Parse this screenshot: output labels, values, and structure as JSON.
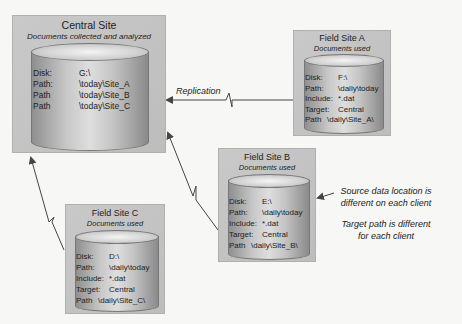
{
  "central": {
    "title": "Central Site",
    "subtitle": "Documents collected and analyzed",
    "rows": [
      {
        "key": "Disk:",
        "value": "G:\\"
      },
      {
        "key": "Path:",
        "value": "\\today\\Site_A"
      },
      {
        "key": "Path",
        "value": "\\today\\Site_B"
      },
      {
        "key": "Path",
        "value": "\\today\\Site_C"
      }
    ]
  },
  "siteA": {
    "title": "Field Site A",
    "subtitle": "Documents used",
    "rows": [
      {
        "key": "Disk:",
        "value": "F:\\"
      },
      {
        "key": "Path:",
        "value": "\\daily\\today"
      },
      {
        "key": "Include:",
        "value": "*.dat"
      },
      {
        "key": "Target:",
        "value": "Central"
      },
      {
        "key": "Path",
        "value": "\\daily\\Site_A\\"
      }
    ]
  },
  "siteB": {
    "title": "Field Site B",
    "subtitle": "Documents used",
    "rows": [
      {
        "key": "Disk:",
        "value": "E:\\"
      },
      {
        "key": "Path:",
        "value": "\\daily\\today"
      },
      {
        "key": "Include:",
        "value": "*.dat"
      },
      {
        "key": "Target:",
        "value": "Central"
      },
      {
        "key": "Path",
        "value": "\\daily\\Site_B\\"
      }
    ]
  },
  "siteC": {
    "title": "Field Site C",
    "subtitle": "Documents used",
    "rows": [
      {
        "key": "Disk:",
        "value": "D:\\"
      },
      {
        "key": "Path:",
        "value": "\\daily\\today"
      },
      {
        "key": "Include:",
        "value": "*.dat"
      },
      {
        "key": "Target:",
        "value": "Central"
      },
      {
        "key": "Path",
        "value": "\\daily\\Site_C\\"
      }
    ]
  },
  "labels": {
    "replication": "Replication",
    "note1_line1": "Source data location is",
    "note1_line2": "different on each client",
    "note2_line1": "Target path is different",
    "note2_line2": "for each client"
  }
}
